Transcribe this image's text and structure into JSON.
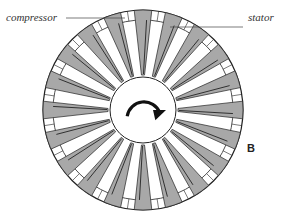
{
  "labels": {
    "compressor": "compressor",
    "stator": "stator",
    "panel_letter": "B"
  },
  "diagram": {
    "blade_count": 20,
    "center": [
      143,
      110
    ],
    "outer_radius": 100,
    "ring_inner_radius": 90,
    "hub_radius": 33,
    "blade_fill": "#a8a8a8",
    "stroke": "#222222",
    "rotation_arrow": "clockwise-arrow"
  }
}
